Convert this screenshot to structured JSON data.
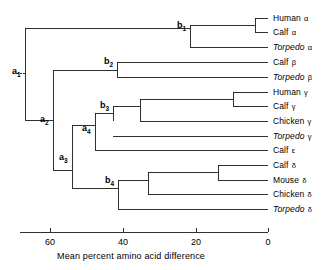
{
  "figure": {
    "type": "phylogenetic-tree-dendrogram",
    "line_color": "#1a1a1a",
    "background_color": "#ffffff"
  },
  "chart_data": {
    "type": "tree",
    "title": "",
    "xlabel": "Mean percent amino acid difference",
    "ylabel": "",
    "xlim": [
      74,
      0
    ],
    "x_ticks": [
      60,
      40,
      20,
      0
    ],
    "x_tick_labels": [
      "60",
      "40",
      "20",
      "0"
    ],
    "axis_direction": "reversed",
    "grid": false,
    "legend": "none",
    "leaves": [
      {
        "id": "human-alpha",
        "genus": "Human",
        "chain": "α",
        "italic": false,
        "y": 18
      },
      {
        "id": "calf-alpha",
        "genus": "Calf",
        "chain": "α",
        "italic": false,
        "y": 32
      },
      {
        "id": "torpedo-alpha",
        "genus": "Torpedo",
        "chain": "α",
        "italic": true,
        "y": 47
      },
      {
        "id": "calf-beta",
        "genus": "Calf",
        "chain": "β",
        "italic": false,
        "y": 62
      },
      {
        "id": "torpedo-beta",
        "genus": "Torpedo",
        "chain": "β",
        "italic": true,
        "y": 77
      },
      {
        "id": "human-gamma",
        "genus": "Human",
        "chain": "γ",
        "italic": false,
        "y": 92
      },
      {
        "id": "calf-gamma",
        "genus": "Calf",
        "chain": "γ",
        "italic": false,
        "y": 106
      },
      {
        "id": "chicken-gamma",
        "genus": "Chicken",
        "chain": "γ",
        "italic": false,
        "y": 121
      },
      {
        "id": "torpedo-gamma",
        "genus": "Torpedo",
        "chain": "γ",
        "italic": true,
        "y": 136
      },
      {
        "id": "calf-epsilon",
        "genus": "Calf",
        "chain": "ε",
        "italic": false,
        "y": 150
      },
      {
        "id": "calf-delta",
        "genus": "Calf",
        "chain": "δ",
        "italic": false,
        "y": 165
      },
      {
        "id": "mouse-delta",
        "genus": "Mouse",
        "chain": "δ",
        "italic": false,
        "y": 180
      },
      {
        "id": "chicken-delta",
        "genus": "Chicken",
        "chain": "δ",
        "italic": false,
        "y": 194
      },
      {
        "id": "torpedo-delta",
        "genus": "Torpedo",
        "chain": "δ",
        "italic": true,
        "y": 209
      }
    ],
    "nodes": [
      {
        "id": "a1",
        "label": "a",
        "subscript": "1",
        "x": 25,
        "y_top": 28,
        "y_bottom": 120,
        "label_x": 12,
        "label_y": 67,
        "labeled": true
      },
      {
        "id": "a2",
        "label": "a",
        "subscript": "2",
        "x": 53,
        "y_top": 70,
        "y_bottom": 170,
        "label_x": 40,
        "label_y": 115,
        "labeled": true
      },
      {
        "id": "a3",
        "label": "a",
        "subscript": "3",
        "x": 72,
        "y_top": 125,
        "y_bottom": 188,
        "label_x": 59,
        "label_y": 153,
        "labeled": true
      },
      {
        "id": "a4",
        "label": "a",
        "subscript": "4",
        "x": 95,
        "y_top": 113,
        "y_bottom": 150,
        "label_x": 82,
        "label_y": 124,
        "labeled": true
      },
      {
        "id": "b1",
        "label": "b",
        "subscript": "1",
        "x": 190,
        "y_top": 25,
        "y_bottom": 47,
        "label_x": 177,
        "label_y": 21,
        "labeled": true
      },
      {
        "id": "b2",
        "label": "b",
        "subscript": "2",
        "x": 117,
        "y_top": 62,
        "y_bottom": 77,
        "label_x": 104,
        "label_y": 57,
        "labeled": true
      },
      {
        "id": "b3",
        "label": "b",
        "subscript": "3",
        "x": 113,
        "y_top": 106,
        "y_bottom": 121,
        "label_x": 100,
        "label_y": 101,
        "labeled": true
      },
      {
        "id": "b4",
        "label": "b",
        "subscript": "4",
        "x": 118,
        "y_top": 180,
        "y_bottom": 209,
        "label_x": 105,
        "label_y": 176,
        "labeled": true
      },
      {
        "id": "n-ha-ca",
        "label": "",
        "subscript": "",
        "x": 255,
        "y_top": 18,
        "y_bottom": 32,
        "labeled": false
      },
      {
        "id": "n-gamma3",
        "label": "",
        "subscript": "",
        "x": 140,
        "y_top": 99,
        "y_bottom": 121,
        "labeled": false
      },
      {
        "id": "n-hg-cg",
        "label": "",
        "subscript": "",
        "x": 233,
        "y_top": 92,
        "y_bottom": 106,
        "labeled": false
      },
      {
        "id": "n-delta3",
        "label": "",
        "subscript": "",
        "x": 148,
        "y_top": 172,
        "y_bottom": 194,
        "labeled": false
      },
      {
        "id": "n-cd-md",
        "label": "",
        "subscript": "",
        "x": 218,
        "y_top": 165,
        "y_bottom": 180,
        "labeled": false
      }
    ],
    "branches": [
      {
        "from_x": 25,
        "to_x": 190,
        "y": 28
      },
      {
        "from_x": 190,
        "to_x": 255,
        "y": 25
      },
      {
        "from_x": 255,
        "to_x": 268,
        "y": 18
      },
      {
        "from_x": 255,
        "to_x": 268,
        "y": 32
      },
      {
        "from_x": 190,
        "to_x": 268,
        "y": 47
      },
      {
        "from_x": 25,
        "to_x": 53,
        "y": 120
      },
      {
        "from_x": 53,
        "to_x": 117,
        "y": 70
      },
      {
        "from_x": 117,
        "to_x": 268,
        "y": 62
      },
      {
        "from_x": 117,
        "to_x": 268,
        "y": 77
      },
      {
        "from_x": 53,
        "to_x": 72,
        "y": 170
      },
      {
        "from_x": 72,
        "to_x": 95,
        "y": 125
      },
      {
        "from_x": 95,
        "to_x": 113,
        "y": 113
      },
      {
        "from_x": 113,
        "to_x": 140,
        "y": 106
      },
      {
        "from_x": 140,
        "to_x": 233,
        "y": 99
      },
      {
        "from_x": 233,
        "to_x": 268,
        "y": 92
      },
      {
        "from_x": 233,
        "to_x": 268,
        "y": 106
      },
      {
        "from_x": 140,
        "to_x": 268,
        "y": 121
      },
      {
        "from_x": 113,
        "to_x": 268,
        "y": 136
      },
      {
        "from_x": 95,
        "to_x": 268,
        "y": 150
      },
      {
        "from_x": 72,
        "to_x": 118,
        "y": 188
      },
      {
        "from_x": 118,
        "to_x": 148,
        "y": 180
      },
      {
        "from_x": 148,
        "to_x": 218,
        "y": 172
      },
      {
        "from_x": 218,
        "to_x": 268,
        "y": 165
      },
      {
        "from_x": 218,
        "to_x": 268,
        "y": 180
      },
      {
        "from_x": 148,
        "to_x": 268,
        "y": 194
      },
      {
        "from_x": 118,
        "to_x": 268,
        "y": 209
      }
    ],
    "root_stub": {
      "x": 25,
      "y": 73,
      "length": 8,
      "style": "dashed"
    },
    "axis": {
      "y": 232,
      "x_start": 20,
      "x_end": 268,
      "tick_height": 4
    },
    "axis_pixel_mapping": {
      "value_0_x": 268,
      "value_20_x": 196,
      "value_40_x": 123,
      "value_60_x": 50
    }
  }
}
